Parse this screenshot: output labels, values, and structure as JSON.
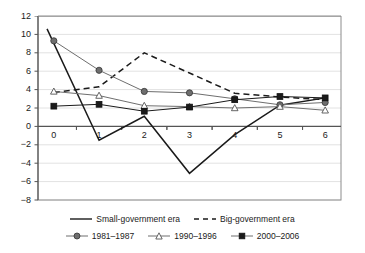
{
  "chart_data": {
    "type": "line",
    "title": "",
    "xlabel": "",
    "ylabel": "",
    "x": [
      0,
      1,
      2,
      3,
      4,
      5,
      6
    ],
    "xticklabels": [
      "0",
      "1",
      "2",
      "3",
      "4",
      "5",
      "6"
    ],
    "yticklabels": [
      "12",
      "10",
      "8",
      "6",
      "4",
      "2",
      "0",
      "-2",
      "-4",
      "-6",
      "-8"
    ],
    "yticks": [
      12,
      10,
      8,
      6,
      4,
      2,
      0,
      -2,
      -4,
      -6,
      -8
    ],
    "ylim": [
      -8,
      12
    ],
    "xlim": [
      -0.35,
      6.35
    ],
    "grid": "horizontal",
    "legend_position": "bottom",
    "series": [
      {
        "name": "Small-government era",
        "style": "solid",
        "marker": "none",
        "color": "#1a1a1a",
        "values": [
          10.6,
          -1.5,
          1.1,
          -5.1,
          -0.9,
          2.3,
          3.1
        ],
        "x": [
          -0.15,
          1,
          2,
          3,
          4,
          5,
          6
        ]
      },
      {
        "name": "Big-government era",
        "style": "dashed",
        "marker": "none",
        "color": "#1a1a1a",
        "values": [
          3.7,
          4.3,
          8.0,
          5.8,
          3.6,
          3.2,
          2.9
        ]
      },
      {
        "name": "1981–1987",
        "style": "solid",
        "marker": "circle",
        "color": "#6e6e6e",
        "values": [
          9.3,
          6.1,
          3.8,
          3.65,
          3.0,
          2.35,
          2.6
        ]
      },
      {
        "name": "1990–1996",
        "style": "solid",
        "marker": "triangle",
        "color": "#6e6e6e",
        "values": [
          3.8,
          3.35,
          2.25,
          2.15,
          2.0,
          2.15,
          1.75
        ]
      },
      {
        "name": "2000–2006",
        "style": "solid",
        "marker": "square",
        "color": "#1a1a1a",
        "values": [
          2.2,
          2.4,
          1.65,
          2.1,
          2.9,
          3.25,
          3.1
        ]
      }
    ]
  },
  "legend": {
    "row1": [
      {
        "label": "Small-government era",
        "style": "solid",
        "marker": "none"
      },
      {
        "label": "Big-government era",
        "style": "dashed",
        "marker": "none"
      }
    ],
    "row2": [
      {
        "label": "1981–1987",
        "style": "solid",
        "marker": "circle"
      },
      {
        "label": "1990–1996",
        "style": "solid",
        "marker": "triangle"
      },
      {
        "label": "2000–2006",
        "style": "solid",
        "marker": "square"
      }
    ]
  },
  "colors": {
    "axis": "#555555",
    "grid": "#e2e2e2",
    "plot_border": "#8c8c8c",
    "dark": "#1a1a1a",
    "gray": "#6e6e6e",
    "background": "#ffffff"
  }
}
